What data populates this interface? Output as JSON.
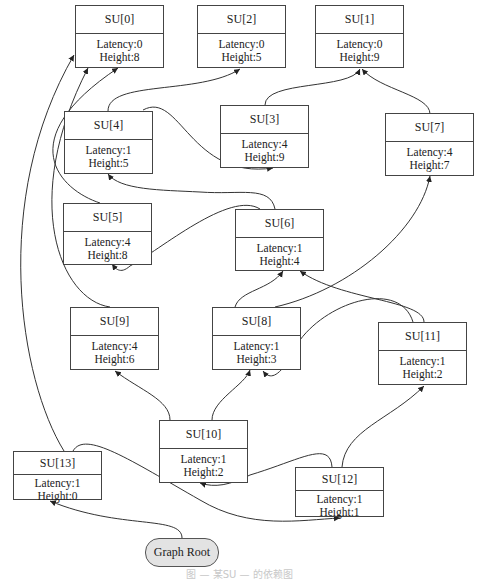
{
  "diagram": {
    "type": "dependency-graph",
    "root": {
      "label": "Graph Root"
    },
    "nodes": [
      {
        "id": "SU[0]",
        "latency": "Latency:0",
        "height": "Height:8"
      },
      {
        "id": "SU[2]",
        "latency": "Latency:0",
        "height": "Height:5"
      },
      {
        "id": "SU[1]",
        "latency": "Latency:0",
        "height": "Height:9"
      },
      {
        "id": "SU[4]",
        "latency": "Latency:1",
        "height": "Height:5"
      },
      {
        "id": "SU[3]",
        "latency": "Latency:4",
        "height": "Height:9"
      },
      {
        "id": "SU[7]",
        "latency": "Latency:4",
        "height": "Height:7"
      },
      {
        "id": "SU[5]",
        "latency": "Latency:4",
        "height": "Height:8"
      },
      {
        "id": "SU[6]",
        "latency": "Latency:1",
        "height": "Height:4"
      },
      {
        "id": "SU[9]",
        "latency": "Latency:4",
        "height": "Height:6"
      },
      {
        "id": "SU[8]",
        "latency": "Latency:1",
        "height": "Height:3"
      },
      {
        "id": "SU[11]",
        "latency": "Latency:1",
        "height": "Height:2"
      },
      {
        "id": "SU[10]",
        "latency": "Latency:1",
        "height": "Height:2"
      },
      {
        "id": "SU[13]",
        "latency": "Latency:1",
        "height": "Height:0"
      },
      {
        "id": "SU[12]",
        "latency": "Latency:1",
        "height": "Height:1"
      }
    ],
    "edges": [
      {
        "from": "Graph Root",
        "to": "SU[13]"
      },
      {
        "from": "SU[13]",
        "to": "SU[0]"
      },
      {
        "from": "SU[13]",
        "to": "SU[12]"
      },
      {
        "from": "SU[12]",
        "to": "SU[10]"
      },
      {
        "from": "SU[12]",
        "to": "SU[11]"
      },
      {
        "from": "SU[10]",
        "to": "SU[9]"
      },
      {
        "from": "SU[10]",
        "to": "SU[8]"
      },
      {
        "from": "SU[11]",
        "to": "SU[8]"
      },
      {
        "from": "SU[11]",
        "to": "SU[6]"
      },
      {
        "from": "SU[8]",
        "to": "SU[6]"
      },
      {
        "from": "SU[8]",
        "to": "SU[7]"
      },
      {
        "from": "SU[9]",
        "to": "SU[0]"
      },
      {
        "from": "SU[6]",
        "to": "SU[5]"
      },
      {
        "from": "SU[6]",
        "to": "SU[4]"
      },
      {
        "from": "SU[5]",
        "to": "SU[0]"
      },
      {
        "from": "SU[4]",
        "to": "SU[2]"
      },
      {
        "from": "SU[4]",
        "to": "SU[3]"
      },
      {
        "from": "SU[3]",
        "to": "SU[1]"
      },
      {
        "from": "SU[7]",
        "to": "SU[1]"
      }
    ],
    "caption": "图 — 某SU — 的依赖图"
  }
}
